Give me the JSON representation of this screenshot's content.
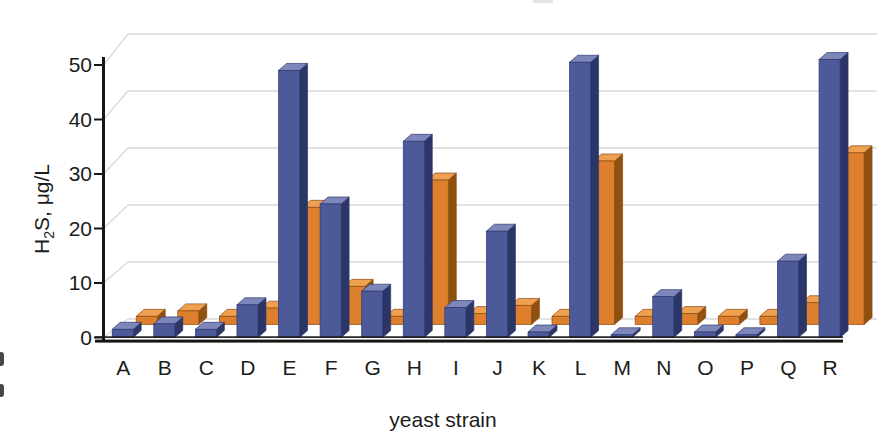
{
  "chart_data": {
    "type": "bar",
    "style": "3d-column",
    "title": "",
    "xlabel": "yeast strain",
    "ylabel": "H2S, μg/L",
    "ylabel_parts": {
      "prefix": "H",
      "sub": "2",
      "suffix": "S, μg/L"
    },
    "categories": [
      "A",
      "B",
      "C",
      "D",
      "E",
      "F",
      "G",
      "H",
      "I",
      "J",
      "K",
      "L",
      "M",
      "N",
      "O",
      "P",
      "Q",
      "R"
    ],
    "series": [
      {
        "name": "blue-front-series",
        "color": "#4d5a9a",
        "color_side": "#2b3566",
        "color_top": "#7d87ba",
        "values": [
          1.5,
          2.5,
          1.5,
          6,
          49,
          24.5,
          8.5,
          36,
          5.5,
          19.5,
          1,
          50.5,
          0.5,
          7.5,
          1,
          0.5,
          14,
          51
        ]
      },
      {
        "name": "orange-back-series",
        "color": "#de7f2d",
        "color_side": "#90500f",
        "color_top": "#efa050",
        "values": [
          1.5,
          2.5,
          1.5,
          3,
          21.5,
          7,
          1.5,
          26.5,
          2,
          3.5,
          1.5,
          30,
          1.5,
          2,
          1.5,
          1.5,
          4,
          31.5
        ]
      }
    ],
    "yticks": [
      0,
      10,
      20,
      30,
      40,
      50
    ],
    "ylim": [
      0,
      55
    ],
    "grid": true,
    "legend_position": "none-visible"
  }
}
